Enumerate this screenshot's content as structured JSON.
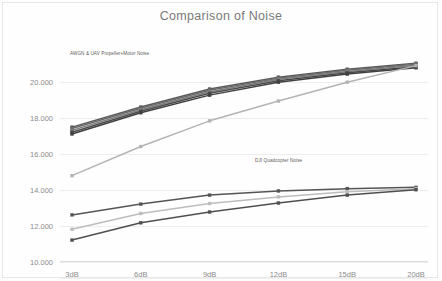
{
  "slide": {
    "title": "Comparison of Noise"
  },
  "annotations": {
    "upper": "AWGN & UAV Propeller+Motor Noise",
    "lower": "DJI Quadcopter Noise"
  },
  "chart_data": {
    "type": "line",
    "title": "Comparison of Noise",
    "xlabel": "",
    "ylabel": "",
    "categories": [
      "3dB",
      "6dB",
      "9dB",
      "12dB",
      "15dB",
      "20dB"
    ],
    "ylim": [
      10.0,
      21.4
    ],
    "yticks": [
      "10.000",
      "12.000",
      "14.000",
      "16.000",
      "18.000",
      "20.000"
    ],
    "ytick_values": [
      10.0,
      12.0,
      14.0,
      16.0,
      18.0,
      20.0
    ],
    "grid": true,
    "legend": "none",
    "annotations": [
      {
        "text": "AWGN & UAV Propeller+Motor Noise",
        "target": "upper-cluster"
      },
      {
        "text": "DJI Quadcopter Noise",
        "target": "lower-cluster"
      }
    ],
    "series": [
      {
        "name": "AWGN & UAV Propeller+Motor Noise A",
        "group": "upper",
        "color": "#595959",
        "values": [
          17.5,
          18.62,
          19.62,
          20.28,
          20.72,
          21.05
        ]
      },
      {
        "name": "AWGN & UAV Propeller+Motor Noise B",
        "group": "upper",
        "color": "#6b6b6b",
        "values": [
          17.42,
          18.55,
          19.55,
          20.22,
          20.66,
          21.0
        ]
      },
      {
        "name": "AWGN & UAV Propeller+Motor Noise C",
        "group": "upper",
        "color": "#7d7d7d",
        "values": [
          17.32,
          18.47,
          19.47,
          20.16,
          20.6,
          20.94
        ]
      },
      {
        "name": "AWGN & UAV Propeller+Motor Noise D",
        "group": "upper",
        "color": "#4a4a4a",
        "values": [
          17.22,
          18.38,
          19.38,
          20.08,
          20.52,
          20.86
        ]
      },
      {
        "name": "AWGN & UAV Propeller+Motor Noise E",
        "group": "upper",
        "color": "#404040",
        "values": [
          17.12,
          18.3,
          19.28,
          20.0,
          20.45,
          20.8
        ]
      },
      {
        "name": "UAV Propeller+Motor Noise (reference)",
        "group": "rising",
        "color": "#b4b4b4",
        "values": [
          14.8,
          16.42,
          17.85,
          18.95,
          20.0,
          20.92
        ]
      },
      {
        "name": "DJI Quadcopter Noise A",
        "group": "lower",
        "color": "#555555",
        "values": [
          12.62,
          13.22,
          13.72,
          13.95,
          14.08,
          14.15
        ]
      },
      {
        "name": "DJI Quadcopter Noise B",
        "group": "lower",
        "color": "#bdbdbd",
        "values": [
          11.82,
          12.7,
          13.25,
          13.62,
          13.9,
          14.08
        ]
      },
      {
        "name": "DJI Quadcopter Noise C",
        "group": "lower",
        "color": "#4f4f4f",
        "values": [
          11.22,
          12.18,
          12.78,
          13.28,
          13.72,
          14.02
        ]
      }
    ]
  }
}
